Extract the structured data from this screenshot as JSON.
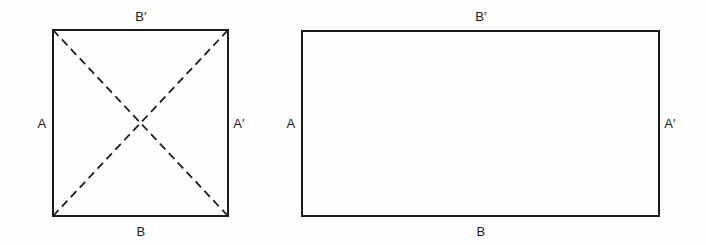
{
  "figure": {
    "background_color": "#fefefe",
    "stroke_color": "#1c1c1c",
    "label_color": "#1c1c1c",
    "panels": [
      {
        "name": "square-panel",
        "shape": "square",
        "geometry": {
          "x": 53,
          "y": 30,
          "width": 175,
          "height": 186
        },
        "has_diagonals": true,
        "diagonals": [
          {
            "name": "diagonal-tl-br",
            "x1": 53,
            "y1": 30,
            "x2": 228,
            "y2": 216,
            "style": "dashed"
          },
          {
            "name": "diagonal-bl-tr",
            "x1": 53,
            "y1": 216,
            "x2": 228,
            "y2": 30,
            "style": "dashed"
          }
        ],
        "labels": {
          "top": "B′",
          "left": "A",
          "right": "A′",
          "bottom": "B"
        },
        "label_positions": {
          "top": {
            "x": 141,
            "y": 16
          },
          "left": {
            "x": 42,
            "y": 123
          },
          "right": {
            "x": 239,
            "y": 123
          },
          "bottom": {
            "x": 141,
            "y": 231
          }
        }
      },
      {
        "name": "rectangle-panel",
        "shape": "rectangle",
        "geometry": {
          "x": 302,
          "y": 31,
          "width": 357,
          "height": 185
        },
        "has_diagonals": false,
        "diagonals": [],
        "labels": {
          "top": "B′",
          "left": "A",
          "right": "A′",
          "bottom": "B"
        },
        "label_positions": {
          "top": {
            "x": 481,
            "y": 16
          },
          "left": {
            "x": 291,
            "y": 123
          },
          "right": {
            "x": 670,
            "y": 123
          },
          "bottom": {
            "x": 481,
            "y": 231
          }
        }
      }
    ]
  }
}
